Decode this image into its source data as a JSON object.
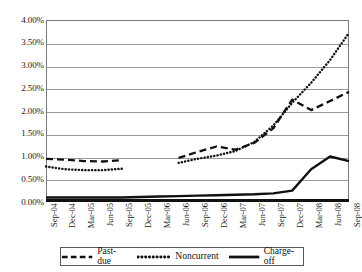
{
  "chart_data": {
    "type": "line",
    "title": "",
    "subtitle": "",
    "xlabel": "",
    "ylabel": "",
    "ylim": [
      0,
      4
    ],
    "ytick_labels": [
      "0.00%",
      "0.50%",
      "1.00%",
      "1.50%",
      "2.00%",
      "2.50%",
      "3.00%",
      "3.50%",
      "4.00%"
    ],
    "ytick_values": [
      0,
      0.5,
      1.0,
      1.5,
      2.0,
      2.5,
      3.0,
      3.5,
      4.0
    ],
    "grid": true,
    "legend_position": "bottom",
    "categories": [
      "Sep-04",
      "Dec-04",
      "Mar-05",
      "Jun-05",
      "Sep-05",
      "Dec-05",
      "Mar-06",
      "Jun-06",
      "Sep-06",
      "Dec-06",
      "Mar-07",
      "Jun-07",
      "Sep-07",
      "Dec-07",
      "Mar-08",
      "Jun-08",
      "Sep-08"
    ],
    "series": [
      {
        "name": "Past-due",
        "style": "dashed",
        "color": "#111111",
        "values": [
          0.95,
          0.93,
          0.9,
          0.89,
          0.92,
          null,
          null,
          0.97,
          1.1,
          1.22,
          1.15,
          1.3,
          1.62,
          2.25,
          2.02,
          2.22,
          2.42
        ]
      },
      {
        "name": "Noncurrent",
        "style": "dotted",
        "color": "#111111",
        "values": [
          0.78,
          0.72,
          0.7,
          0.7,
          0.73,
          null,
          null,
          0.86,
          0.95,
          1.02,
          1.12,
          1.32,
          1.68,
          2.18,
          2.62,
          3.12,
          3.72
        ]
      },
      {
        "name": "Charge-off",
        "style": "solid",
        "color": "#111111",
        "values": [
          0.1,
          0.1,
          0.1,
          0.1,
          0.1,
          0.11,
          0.12,
          0.13,
          0.14,
          0.15,
          0.16,
          0.17,
          0.19,
          0.25,
          0.72,
          1.0,
          0.9
        ]
      }
    ]
  },
  "legend": {
    "entries": [
      {
        "label": "Past-due",
        "icon": "dashed-line-swatch"
      },
      {
        "label": "Noncurrent",
        "icon": "dotted-line-swatch"
      },
      {
        "label": "Charge-off",
        "icon": "solid-line-swatch"
      }
    ]
  }
}
